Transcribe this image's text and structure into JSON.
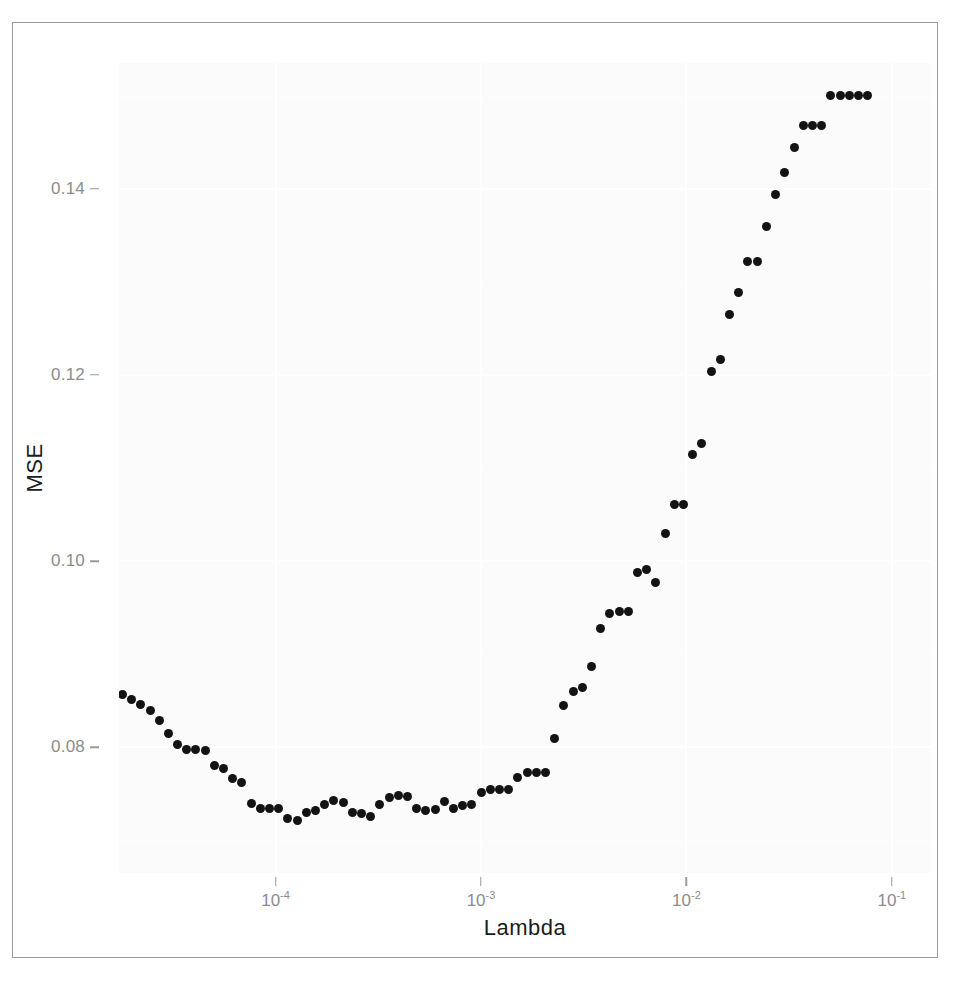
{
  "figure": {
    "kind": "scatter-plot",
    "background": "#ffffff",
    "panel_background": "#fbfbfb",
    "frame_color": "#9a9a9a",
    "point_color": "#131313",
    "axis_text_color": "#8c8c8c",
    "axis_title_color": "#1b1b1b"
  },
  "axes": {
    "y": {
      "label": "MSE",
      "ticks": [
        {
          "label": "0.08",
          "value": 0.08
        },
        {
          "label": "0.10",
          "value": 0.1
        },
        {
          "label": "0.12",
          "value": 0.12
        },
        {
          "label": "0.14",
          "value": 0.14
        }
      ],
      "range": [
        0.0665,
        0.1535
      ]
    },
    "x": {
      "label": "Lambda",
      "scale": "log10",
      "ticks": [
        {
          "base": "10",
          "exp": "-4",
          "value": 0.0001
        },
        {
          "base": "10",
          "exp": "-3",
          "value": 0.001
        },
        {
          "base": "10",
          "exp": "-2",
          "value": 0.01
        },
        {
          "base": "10",
          "exp": "-1",
          "value": 0.1
        }
      ],
      "range": [
        1.73e-05,
        0.155
      ]
    }
  },
  "chart_data": {
    "type": "scatter",
    "title": "",
    "subtitle": "",
    "xlabel": "Lambda",
    "ylabel": "MSE",
    "xscale": "log",
    "yscale": "linear",
    "xlim": [
      1.73e-05,
      0.155
    ],
    "ylim": [
      0.0665,
      0.1535
    ],
    "grid": true,
    "legend": null,
    "annotations": [],
    "series": [
      {
        "name": "MSE",
        "marker": "filled-circle",
        "color": "#131313",
        "points": [
          [
            1.8e-05,
            0.0857
          ],
          [
            1.99e-05,
            0.0851
          ],
          [
            2.21e-05,
            0.0846
          ],
          [
            2.45e-05,
            0.084
          ],
          [
            2.71e-05,
            0.0829
          ],
          [
            3.01e-05,
            0.0815
          ],
          [
            3.33e-05,
            0.0803
          ],
          [
            3.7e-05,
            0.0798
          ],
          [
            4.1e-05,
            0.0798
          ],
          [
            4.54e-05,
            0.0797
          ],
          [
            5.04e-05,
            0.0781
          ],
          [
            5.58e-05,
            0.0777
          ],
          [
            6.19e-05,
            0.0766
          ],
          [
            6.86e-05,
            0.0762
          ],
          [
            7.61e-05,
            0.074
          ],
          [
            8.43e-05,
            0.0734
          ],
          [
            9.35e-05,
            0.0734
          ],
          [
            0.0001036,
            0.0734
          ],
          [
            0.0001149,
            0.0724
          ],
          [
            0.0001273,
            0.0721
          ],
          [
            0.0001412,
            0.073
          ],
          [
            0.0001565,
            0.0732
          ],
          [
            0.0001735,
            0.0739
          ],
          [
            0.0001923,
            0.0743
          ],
          [
            0.0002132,
            0.0741
          ],
          [
            0.0002364,
            0.073
          ],
          [
            0.0002621,
            0.0729
          ],
          [
            0.0002905,
            0.0726
          ],
          [
            0.0003221,
            0.0739
          ],
          [
            0.0003571,
            0.0746
          ],
          [
            0.0003959,
            0.0748
          ],
          [
            0.0004389,
            0.0747
          ],
          [
            0.0004866,
            0.0734
          ],
          [
            0.0005394,
            0.0732
          ],
          [
            0.000598,
            0.0733
          ],
          [
            0.000663,
            0.0742
          ],
          [
            0.000735,
            0.0734
          ],
          [
            0.0008148,
            0.0738
          ],
          [
            0.0009033,
            0.0739
          ],
          [
            0.0010014,
            0.0752
          ],
          [
            0.0011102,
            0.0755
          ],
          [
            0.0012308,
            0.0755
          ],
          [
            0.0013645,
            0.0755
          ],
          [
            0.0015127,
            0.0768
          ],
          [
            0.0016771,
            0.0773
          ],
          [
            0.0018593,
            0.0773
          ],
          [
            0.0020613,
            0.0773
          ],
          [
            0.0022852,
            0.081
          ],
          [
            0.0025335,
            0.0845
          ],
          [
            0.0028087,
            0.086
          ],
          [
            0.0031138,
            0.0864
          ],
          [
            0.0034521,
            0.0887
          ],
          [
            0.0038271,
            0.0928
          ],
          [
            0.0042429,
            0.0944
          ],
          [
            0.0047039,
            0.0946
          ],
          [
            0.0052149,
            0.0946
          ],
          [
            0.0057813,
            0.0988
          ],
          [
            0.0064094,
            0.0991
          ],
          [
            0.0071058,
            0.0977
          ],
          [
            0.0078778,
            0.103
          ],
          [
            0.0087337,
            0.1061
          ],
          [
            0.0096825,
            0.1061
          ],
          [
            0.0107345,
            0.1114
          ],
          [
            0.0119007,
            0.1126
          ],
          [
            0.0131936,
            0.1204
          ],
          [
            0.0146271,
            0.1217
          ],
          [
            0.0162165,
            0.1265
          ],
          [
            0.0179785,
            0.1289
          ],
          [
            0.0199319,
            0.1322
          ],
          [
            0.0220974,
            0.1322
          ],
          [
            0.0244983,
            0.1359
          ],
          [
            0.0271598,
            0.1394
          ],
          [
            0.0301106,
            0.1417
          ],
          [
            0.0333817,
            0.1444
          ],
          [
            0.037008,
            0.1468
          ],
          [
            0.041028,
            0.1468
          ],
          [
            0.045484,
            0.1468
          ],
          [
            0.0504237,
            0.15
          ],
          [
            0.0558999,
            0.15
          ],
          [
            0.0619715,
            0.15
          ],
          [
            0.0687045,
            0.15
          ],
          [
            0.0761725,
            0.15
          ]
        ]
      }
    ]
  }
}
